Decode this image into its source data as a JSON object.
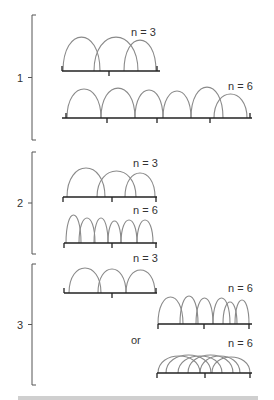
{
  "colors": {
    "arc": "#8a8a8a",
    "axis": "#222222",
    "bracket": "#555555",
    "text": "#333333"
  },
  "groups": [
    {
      "label": "1",
      "bracket": {
        "x": 32,
        "y1": 15,
        "y2": 140
      },
      "panels": [
        {
          "label": "n = 3",
          "label_x": 131,
          "label_y": 36,
          "line_y": 71,
          "x1": 62,
          "x2": 160,
          "ticks": [
            62,
            109,
            157
          ],
          "tick_dirs": [
            "up",
            "down",
            "up"
          ],
          "arcs": [
            [
              63,
              100
            ],
            [
              94,
              138
            ],
            [
              124,
              156
            ]
          ],
          "arc_heights": [
            34,
            34,
            31
          ]
        },
        {
          "label": "n = 6",
          "label_x": 228,
          "label_y": 90,
          "line_y": 118,
          "x1": 62,
          "x2": 252,
          "ticks": [
            66,
            107,
            157,
            210,
            250
          ],
          "tick_dirs": [
            "up",
            "down",
            "down",
            "down",
            "up"
          ],
          "arcs": [
            [
              67,
              101
            ],
            [
              101,
              135
            ],
            [
              135,
              163
            ],
            [
              163,
              191
            ],
            [
              191,
              223
            ],
            [
              214,
              247
            ]
          ],
          "arc_heights": [
            29,
            30,
            28,
            27,
            31,
            24
          ]
        }
      ]
    },
    {
      "label": "2",
      "bracket": {
        "x": 32,
        "y1": 152,
        "y2": 254
      },
      "panels": [
        {
          "label": "n = 3",
          "label_x": 133,
          "label_y": 167,
          "line_y": 197,
          "x1": 63,
          "x2": 157,
          "ticks": [
            63,
            112,
            156
          ],
          "tick_dirs": [
            "down",
            "down",
            "down"
          ],
          "arcs": [
            [
              67,
              105
            ],
            [
              97,
              136
            ],
            [
              125,
              155
            ]
          ],
          "arc_heights": [
            29,
            26,
            24
          ]
        },
        {
          "label": "n = 6",
          "label_x": 133,
          "label_y": 214,
          "line_y": 243,
          "x1": 64,
          "x2": 157,
          "ticks": [
            64,
            112,
            156
          ],
          "tick_dirs": [
            "down",
            "down",
            "down"
          ],
          "arcs": [
            [
              66,
              81
            ],
            [
              79,
              95
            ],
            [
              94,
              108
            ],
            [
              108,
              121
            ],
            [
              121,
              137
            ],
            [
              137,
              153
            ]
          ],
          "arc_heights": [
            28,
            25,
            25,
            22,
            23,
            23
          ]
        }
      ]
    },
    {
      "label": "3",
      "bracket": {
        "x": 32,
        "y1": 264,
        "y2": 385
      },
      "panels": [
        {
          "label": "n = 3",
          "label_x": 133,
          "label_y": 262,
          "line_y": 293,
          "x1": 64,
          "x2": 157,
          "ticks": [
            64,
            112,
            156
          ],
          "tick_dirs": [
            "up",
            "down",
            "up"
          ],
          "arcs": [
            [
              69,
              101
            ],
            [
              98,
              126
            ],
            [
              126,
              155
            ]
          ],
          "arc_heights": [
            25,
            24,
            23
          ]
        },
        {
          "label": "n = 6",
          "label_x": 228,
          "label_y": 292,
          "line_y": 324,
          "x1": 158,
          "x2": 252,
          "ticks": [
            158,
            204,
            249
          ],
          "tick_dirs": [
            "down",
            "down",
            "down"
          ],
          "arcs": [
            [
              158,
              183
            ],
            [
              180,
              198
            ],
            [
              196,
              213
            ],
            [
              213,
              230
            ],
            [
              223,
              237
            ],
            [
              235,
              249
            ]
          ],
          "arc_heights": [
            27,
            28,
            26,
            26,
            22,
            24
          ]
        },
        {
          "label": "n = 6",
          "label_x": 228,
          "label_y": 347,
          "line_y": 373,
          "x1": 157,
          "x2": 252,
          "ticks": [
            157,
            205,
            250
          ],
          "tick_dirs": [
            "down",
            "down",
            "down"
          ],
          "arcs": [
            [
              158,
              200
            ],
            [
              166,
              211
            ],
            [
              178,
              222
            ],
            [
              188,
              233
            ],
            [
              200,
              240
            ],
            [
              212,
              250
            ]
          ],
          "arc_heights": [
            17,
            18,
            17,
            18,
            17,
            16
          ]
        }
      ]
    }
  ],
  "connector": {
    "label": "or",
    "x": 131,
    "y": 344
  },
  "caption_visible_fragment": ""
}
